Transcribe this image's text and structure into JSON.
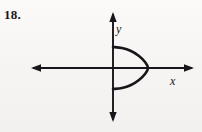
{
  "figure": {
    "problem_number": "18.",
    "background_color": "#f7f6f4",
    "ink_color": "#17161a"
  },
  "axes": {
    "x_axis_label": "x",
    "y_axis_label": "y",
    "origin_px": [
      113,
      68
    ],
    "x_axis_extent_px": [
      31,
      194
    ],
    "y_axis_extent_px": [
      12,
      122
    ],
    "arrowheads": [
      "left",
      "right",
      "up",
      "down"
    ],
    "tick_marks": "none",
    "grid": "off"
  },
  "chart_data": {
    "type": "line",
    "title": "",
    "subtitle": "",
    "xlabel": "x",
    "ylabel": "y",
    "grid": false,
    "legend": "none",
    "axis_style": "double-arrow cartesian axes, unlabeled ticks",
    "curve_name": "sideways parabola opening right",
    "vertex_px": [
      148,
      68
    ],
    "endpoints_px": [
      [
        113,
        47
      ],
      [
        113,
        89
      ]
    ],
    "opens": "right",
    "symmetry_axis": "x-axis",
    "fails_vertical_line_test": true,
    "series": [
      {
        "name": "sideways parabola",
        "points_px": [
          [
            113,
            47
          ],
          [
            122,
            48
          ],
          [
            131,
            51
          ],
          [
            139,
            56
          ],
          [
            145,
            62
          ],
          [
            148,
            68
          ],
          [
            145,
            74
          ],
          [
            139,
            80
          ],
          [
            131,
            85
          ],
          [
            122,
            88
          ],
          [
            113,
            89
          ]
        ]
      }
    ]
  }
}
